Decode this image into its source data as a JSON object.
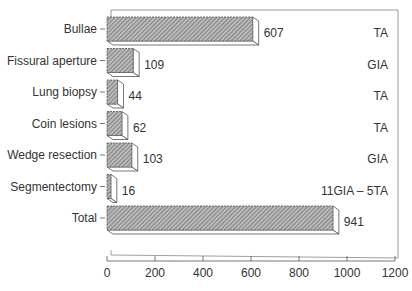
{
  "chart_data": {
    "type": "bar",
    "orientation": "horizontal",
    "style": "3d",
    "title": "",
    "xlabel": "",
    "ylabel": "",
    "categories": [
      "Bullae",
      "Fissural aperture",
      "Lung biopsy",
      "Coin lesions",
      "Wedge resection",
      "Segmentectomy",
      "Total"
    ],
    "values": [
      607,
      109,
      44,
      62,
      103,
      16,
      941
    ],
    "value_labels": [
      "607",
      "109",
      "44",
      "62",
      "103",
      "16",
      "941"
    ],
    "annotations": [
      "TA",
      "GIA",
      "TA",
      "TA",
      "GIA",
      "11GIA – 5TA",
      ""
    ],
    "xlim": [
      0,
      1200
    ],
    "xticks": [
      0,
      200,
      400,
      600,
      800,
      1000,
      1200
    ],
    "xtick_labels": [
      "0",
      "200",
      "400",
      "600",
      "800",
      "1000",
      "1200"
    ],
    "grid": false,
    "legend": null,
    "bar_fill": "diagonal-hatch",
    "colors": {
      "bar": "#9a9a9a",
      "hatch": "#6f6f6f",
      "outline": "#555555",
      "frame": "#999999"
    }
  }
}
